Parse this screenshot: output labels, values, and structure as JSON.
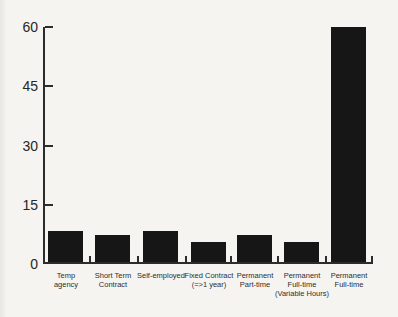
{
  "chart_data": {
    "type": "bar",
    "title": "",
    "xlabel": "",
    "ylabel": "",
    "categories": [
      "Temp agency",
      "Short Term Contract",
      "Self-employed",
      "Fixed Contract (=>1 year)",
      "Permanent Part-time",
      "Permanent Full-time (Variable Hours)",
      "Permanent Full-time"
    ],
    "labels_multiline": [
      "Temp\nagency",
      "Short Term\nContract",
      "Self-employed",
      "Fixed Contract\n(=>1 year)",
      "Permanent\nPart-time",
      "Permanent\nFull-time\n(Variable Hours)",
      "Permanent\nFull-time"
    ],
    "values": [
      8,
      7,
      8,
      5,
      7,
      5,
      60
    ],
    "yticks": [
      0,
      15,
      30,
      45,
      60
    ],
    "ylim": [
      0,
      60
    ],
    "grid": false,
    "legend_position": "none",
    "bar_color": "#161616",
    "axis_color": "#2c2c2c",
    "background_color": "#f5f4f1"
  }
}
